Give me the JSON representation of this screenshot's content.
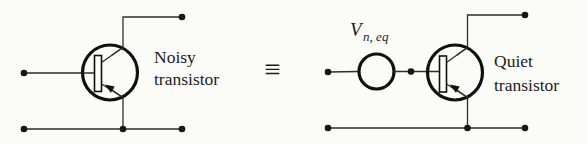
{
  "figure": {
    "colors": {
      "background": "#fbfbf8",
      "wire": "#2e2e2e",
      "symbol": "#101010",
      "text": "#1b1b1b"
    },
    "left_circuit": {
      "caption_line1": "Noisy",
      "caption_line2": "transistor"
    },
    "equivalence_symbol": "≡",
    "right_circuit": {
      "source_label": "V",
      "source_label_subscript": "n, eq",
      "caption_line1": "Quiet",
      "caption_line2": "transistor"
    }
  }
}
